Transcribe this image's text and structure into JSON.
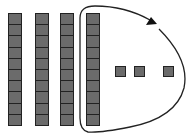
{
  "diagram": {
    "rods": [
      {
        "id": "rod-1",
        "x": 8,
        "cells": 10
      },
      {
        "id": "rod-2",
        "x": 35,
        "cells": 10
      },
      {
        "id": "rod-3",
        "x": 60,
        "cells": 10
      },
      {
        "id": "rod-4",
        "x": 86,
        "cells": 10,
        "circled": true
      }
    ],
    "units": [
      {
        "id": "unit-1",
        "x": 115
      },
      {
        "id": "unit-2",
        "x": 134
      },
      {
        "id": "unit-3",
        "x": 163
      }
    ],
    "colors": {
      "block_fill": "#6b6b6b",
      "block_border": "#222222",
      "line": "#222222",
      "background": "#ffffff"
    }
  }
}
